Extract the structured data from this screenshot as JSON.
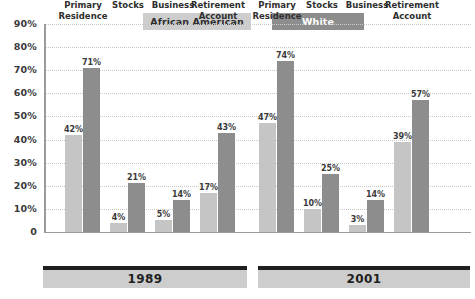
{
  "legend": {
    "position": "top-center",
    "items": [
      {
        "label": "African American",
        "color": "#c5c5c5",
        "text_color": "#2e2e2e"
      },
      {
        "label": "White",
        "color": "#8d8d8d",
        "text_color": "#ffffff"
      }
    ]
  },
  "axis": {
    "y_ticks": [
      "90%",
      "80%",
      "70%",
      "60%",
      "50%",
      "40%",
      "30%",
      "20%",
      "10%",
      "0"
    ],
    "y_values": [
      90,
      80,
      70,
      60,
      50,
      40,
      30,
      20,
      10,
      0
    ]
  },
  "groups": [
    {
      "year": "1989",
      "categories": [
        {
          "line1": "Primary",
          "line2": "Residence"
        },
        {
          "line1": "Stocks",
          "line2": ""
        },
        {
          "line1": "Business",
          "line2": ""
        },
        {
          "line1": "Retirement",
          "line2": "Account"
        }
      ],
      "bars": [
        {
          "aa": 42,
          "wh": 71,
          "aa_label": "42%",
          "wh_label": "71%"
        },
        {
          "aa": 4,
          "wh": 21,
          "aa_label": "4%",
          "wh_label": "21%"
        },
        {
          "aa": 5,
          "wh": 14,
          "aa_label": "5%",
          "wh_label": "14%"
        },
        {
          "aa": 17,
          "wh": 43,
          "aa_label": "17%",
          "wh_label": "43%"
        }
      ]
    },
    {
      "year": "2001",
      "categories": [
        {
          "line1": "Primary",
          "line2": "Residence"
        },
        {
          "line1": "Stocks",
          "line2": ""
        },
        {
          "line1": "Business",
          "line2": ""
        },
        {
          "line1": "Retirement",
          "line2": "Account"
        }
      ],
      "bars": [
        {
          "aa": 47,
          "wh": 74,
          "aa_label": "47%",
          "wh_label": "74%"
        },
        {
          "aa": 10,
          "wh": 25,
          "aa_label": "10%",
          "wh_label": "25%"
        },
        {
          "aa": 3,
          "wh": 14,
          "aa_label": "3%",
          "wh_label": "14%"
        },
        {
          "aa": 39,
          "wh": 57,
          "aa_label": "39%",
          "wh_label": "57%"
        }
      ]
    }
  ],
  "chart_data": {
    "type": "bar",
    "title": "",
    "subtitle": "",
    "xlabel": "",
    "ylabel": "",
    "ylim": [
      0,
      90
    ],
    "grid": true,
    "legend_position": "top-center",
    "categories": [
      "1989 Primary Residence",
      "1989 Stocks",
      "1989 Business",
      "1989 Retirement Account",
      "2001 Primary Residence",
      "2001 Stocks",
      "2001 Business",
      "2001 Retirement Account"
    ],
    "series": [
      {
        "name": "African American",
        "color": "#c5c5c5",
        "values": [
          42,
          4,
          5,
          17,
          47,
          10,
          3,
          39
        ]
      },
      {
        "name": "White",
        "color": "#8d8d8d",
        "values": [
          71,
          21,
          14,
          43,
          74,
          25,
          14,
          57
        ]
      }
    ],
    "tick_labels": [
      "90%",
      "80%",
      "70%",
      "60%",
      "50%",
      "40%",
      "30%",
      "20%",
      "10%",
      "0"
    ],
    "annotations": [
      "1989",
      "2001"
    ]
  },
  "colors": {
    "african_american_bar": "#c5c5c5",
    "white_bar": "#8d8d8d",
    "gridline": "#c9c9c9",
    "axis": "#9a9a9a",
    "year_band_bg": "#cdcdcd",
    "year_band_rule": "#1f1f1f",
    "background": "#ffffff"
  }
}
